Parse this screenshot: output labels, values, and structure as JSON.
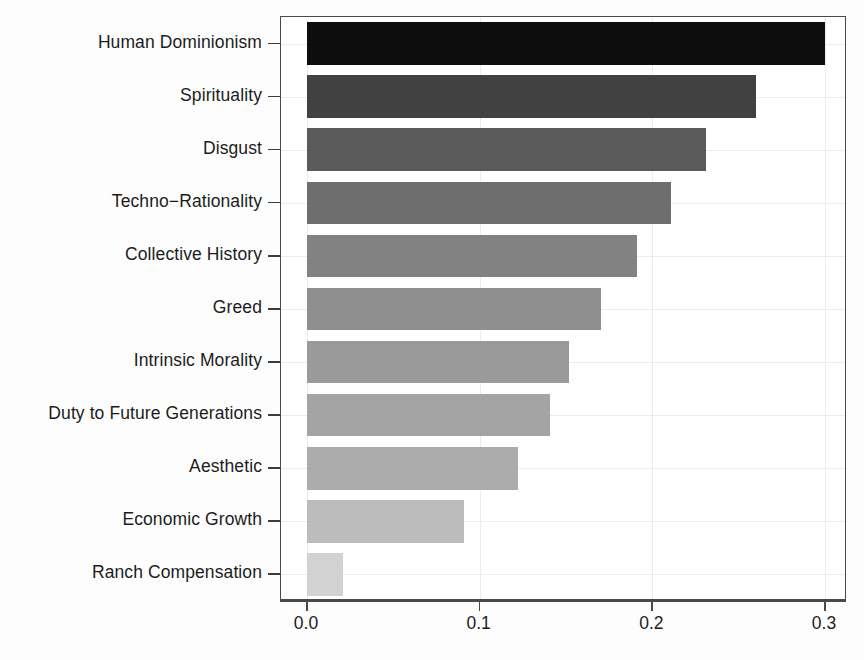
{
  "chart_data": {
    "type": "bar",
    "orientation": "horizontal",
    "title": "",
    "subtitle": "",
    "xlabel": "",
    "ylabel": "",
    "xlim": [
      0.0,
      0.3
    ],
    "xticks": [
      "0.0",
      "0.1",
      "0.2",
      "0.3"
    ],
    "xtick_values": [
      0.0,
      0.1,
      0.2,
      0.3
    ],
    "grid": true,
    "legend": false,
    "categories": [
      "Human Dominionism",
      "Spirituality",
      "Disgust",
      "Techno−Rationality",
      "Collective History",
      "Greed",
      "Intrinsic Morality",
      "Duty to Future Generations",
      "Aesthetic",
      "Economic Growth",
      "Ranch Compensation"
    ],
    "values": [
      0.3,
      0.26,
      0.231,
      0.211,
      0.191,
      0.17,
      0.152,
      0.141,
      0.122,
      0.091,
      0.021
    ],
    "bar_colors": [
      "#0d0d0d",
      "#414141",
      "#5a5a5a",
      "#6e6e6e",
      "#828282",
      "#8f8f8f",
      "#9a9a9a",
      "#a4a4a4",
      "#acacac",
      "#bcbcbc",
      "#d2d2d2"
    ],
    "axis_color": "#4a4a4a",
    "grid_color": "#ececee",
    "text_color": "#1c1c1c",
    "background": "#ffffff"
  }
}
